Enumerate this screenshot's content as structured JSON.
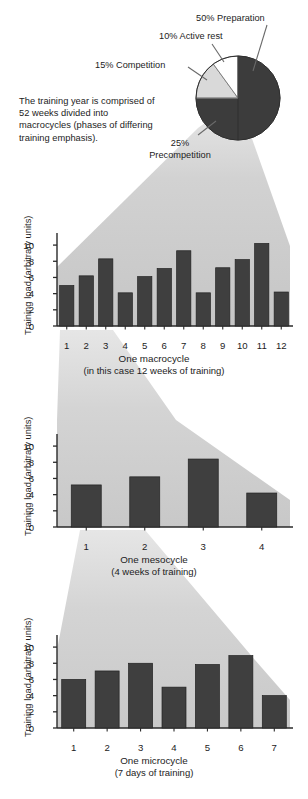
{
  "figure": {
    "intro_text": "The training year is comprised of 52 weeks divided into macrocycles (phases of differing training emphasis).",
    "colors": {
      "bar_dark": "#3f3f3f",
      "pie_dark": "#3c3c3c",
      "pie_light": "#d9d9d9",
      "pie_white": "#ffffff",
      "cone_gray": "#cfcfcf",
      "axis": "#2a2a2a",
      "text": "#1c1c1c"
    }
  },
  "chart_data": [
    {
      "type": "pie",
      "title": "",
      "legend_position": "callout-labels",
      "labels": [
        "50% Preparation",
        "10% Active rest",
        "15% Competition",
        "25% Precompetition"
      ],
      "slice_labels": [
        "Preparation",
        "Active rest",
        "Competition",
        "Precompetition"
      ],
      "values": [
        50,
        10,
        15,
        25
      ],
      "units": "percent",
      "slice_colors": [
        "#3c3c3c",
        "#ffffff",
        "#d9d9d9",
        "#3c3c3c"
      ],
      "note": "Right half = 50% Preparation (dark); top-left white wedge = 10% Active rest; left light-gray wedge = 15% Competition; bottom-left dark = 25% Precompetition"
    },
    {
      "type": "bar",
      "name": "macrocycle",
      "categories": [
        "1",
        "2",
        "3",
        "4",
        "5",
        "6",
        "7",
        "8",
        "9",
        "10",
        "11",
        "12"
      ],
      "values": [
        5.0,
        6.2,
        8.3,
        4.1,
        6.1,
        7.1,
        9.3,
        4.1,
        7.2,
        8.2,
        10.2,
        4.2
      ],
      "title": "",
      "xlabel": "One macrocycle",
      "xsublabel": "(in this case 12 weeks of training)",
      "ylabel": "Training load (arbitrary units)",
      "yticks": [
        "0",
        "2",
        "4",
        "6",
        "8",
        "10"
      ],
      "ylim": [
        0,
        11
      ],
      "grid": false
    },
    {
      "type": "bar",
      "name": "mesocycle",
      "categories": [
        "1",
        "2",
        "3",
        "4"
      ],
      "values": [
        5.2,
        6.2,
        8.4,
        4.2
      ],
      "title": "",
      "xlabel": "One mesocycle",
      "xsublabel": "(4 weeks of training)",
      "ylabel": "Training load (arbitrary units)",
      "yticks": [
        "0",
        "2",
        "4",
        "6",
        "8",
        "10"
      ],
      "ylim": [
        0,
        11
      ],
      "grid": false
    },
    {
      "type": "bar",
      "name": "microcycle",
      "categories": [
        "1",
        "2",
        "3",
        "4",
        "5",
        "6",
        "7"
      ],
      "values": [
        6.0,
        7.05,
        8.0,
        5.05,
        7.85,
        8.95,
        4.0
      ],
      "title": "",
      "xlabel": "One microcycle",
      "xsublabel": "(7 days of training)",
      "ylabel": "Training load (arbitrary units)",
      "yticks": [
        "0",
        "2",
        "4",
        "6",
        "8",
        "10"
      ],
      "ylim": [
        0,
        11
      ],
      "grid": false
    }
  ]
}
